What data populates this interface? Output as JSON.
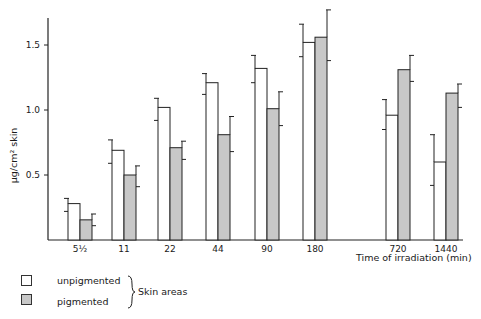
{
  "chart_data": {
    "type": "bar",
    "title": "",
    "xlabel": "Time of irradiation (min)",
    "ylabel": "µg/cm² skin",
    "ylim": [
      0,
      1.75
    ],
    "yticks": [
      0.5,
      1.0,
      1.5
    ],
    "ytick_labels": [
      "0.5",
      "1.0",
      "1.5"
    ],
    "categories": [
      "5½",
      "11",
      "22",
      "44",
      "90",
      "180",
      "720",
      "1440"
    ],
    "series": [
      {
        "name": "unpigmented",
        "fill": "#ffffff",
        "values": [
          0.28,
          0.69,
          1.02,
          1.21,
          1.32,
          1.52,
          0.96,
          0.6
        ],
        "error_upper": [
          0.32,
          0.77,
          1.09,
          1.28,
          1.42,
          1.66,
          1.08,
          0.81
        ],
        "error_lower": [
          0.22,
          0.59,
          0.92,
          1.12,
          1.21,
          1.41,
          0.85,
          0.42
        ]
      },
      {
        "name": "pigmented",
        "fill": "#c8c8c8",
        "values": [
          0.155,
          0.5,
          0.71,
          0.81,
          1.01,
          1.56,
          1.31,
          1.13
        ],
        "error_upper": [
          0.2,
          0.57,
          0.76,
          0.95,
          1.14,
          1.77,
          1.42,
          1.2
        ],
        "error_lower": [
          0.11,
          0.41,
          0.62,
          0.68,
          0.88,
          1.38,
          1.22,
          1.02
        ]
      }
    ],
    "legend": {
      "position": "bottom-left",
      "entries": [
        "unpigmented",
        "pigmented"
      ],
      "group_label": "Skin areas"
    },
    "grid": false
  },
  "layout": {
    "group_left_x": [
      68,
      112,
      158,
      206,
      255,
      303,
      386,
      434
    ],
    "bar_width": 12
  },
  "labels": {
    "ylabel": "µg/cm² skin",
    "xlabel": "Time of irradiation (min)",
    "legend_unpigmented": "unpigmented",
    "legend_pigmented": "pigmented",
    "legend_group": "Skin areas"
  }
}
